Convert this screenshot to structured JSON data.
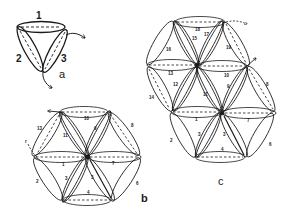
{
  "figure": {
    "style": {
      "ink": "#1a1a1a",
      "background": "#ffffff"
    },
    "panels": [
      {
        "id": "a",
        "label": "a",
        "description": "three lens-shaped loops arranged in a triangle",
        "loop_labels": [
          "1",
          "2",
          "3"
        ]
      },
      {
        "id": "b",
        "label": "b",
        "description": "hexagonal arrangement of lens-shaped loops around a central node",
        "loop_labels": [
          "1",
          "2",
          "3",
          "3",
          "4",
          "5",
          "6",
          "7",
          "8",
          "9",
          "10",
          "11",
          "13"
        ],
        "start_marker": "r"
      },
      {
        "id": "c",
        "label": "c",
        "description": "extended arrangement of two hexagons of lens-shaped loops",
        "loop_labels": [
          "1",
          "2",
          "3",
          "3",
          "4",
          "6",
          "7",
          "8",
          "9",
          "10",
          "11",
          "12",
          "13",
          "14",
          "15",
          "16",
          "17",
          "17",
          "18",
          "19"
        ]
      }
    ]
  }
}
